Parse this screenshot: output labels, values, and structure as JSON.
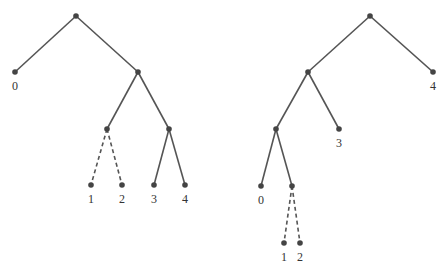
{
  "colors": {
    "edge": "#555555",
    "node": "#444444",
    "label": "#333333",
    "background": "#ffffff"
  },
  "trees": [
    {
      "name": "left-tree",
      "nodes": [
        {
          "id": "r",
          "x": 76,
          "y": 16,
          "label": ""
        },
        {
          "id": "l0",
          "x": 15,
          "y": 72,
          "label": "0"
        },
        {
          "id": "a",
          "x": 138,
          "y": 72,
          "label": ""
        },
        {
          "id": "b",
          "x": 107,
          "y": 129,
          "label": ""
        },
        {
          "id": "c",
          "x": 169,
          "y": 129,
          "label": ""
        },
        {
          "id": "l1",
          "x": 91,
          "y": 185,
          "label": "1"
        },
        {
          "id": "l2",
          "x": 122,
          "y": 185,
          "label": "2"
        },
        {
          "id": "l3",
          "x": 154,
          "y": 185,
          "label": "3"
        },
        {
          "id": "l4",
          "x": 185,
          "y": 185,
          "label": "4"
        }
      ],
      "edges": [
        {
          "from": "r",
          "to": "l0",
          "style": "solid"
        },
        {
          "from": "r",
          "to": "a",
          "style": "solid"
        },
        {
          "from": "a",
          "to": "b",
          "style": "solid"
        },
        {
          "from": "a",
          "to": "c",
          "style": "solid"
        },
        {
          "from": "b",
          "to": "l1",
          "style": "dashed"
        },
        {
          "from": "b",
          "to": "l2",
          "style": "dashed"
        },
        {
          "from": "c",
          "to": "l3",
          "style": "solid"
        },
        {
          "from": "c",
          "to": "l4",
          "style": "solid"
        }
      ]
    },
    {
      "name": "right-tree",
      "nodes": [
        {
          "id": "r",
          "x": 370,
          "y": 16,
          "label": ""
        },
        {
          "id": "l4",
          "x": 433,
          "y": 72,
          "label": "4"
        },
        {
          "id": "a",
          "x": 308,
          "y": 72,
          "label": ""
        },
        {
          "id": "b",
          "x": 276,
          "y": 129,
          "label": ""
        },
        {
          "id": "l3",
          "x": 339,
          "y": 129,
          "label": "3"
        },
        {
          "id": "l0",
          "x": 261,
          "y": 186,
          "label": "0"
        },
        {
          "id": "c",
          "x": 292,
          "y": 186,
          "label": ""
        },
        {
          "id": "l1",
          "x": 284,
          "y": 243,
          "label": "1"
        },
        {
          "id": "l2",
          "x": 300,
          "y": 243,
          "label": "2"
        }
      ],
      "edges": [
        {
          "from": "r",
          "to": "a",
          "style": "solid"
        },
        {
          "from": "r",
          "to": "l4",
          "style": "solid"
        },
        {
          "from": "a",
          "to": "b",
          "style": "solid"
        },
        {
          "from": "a",
          "to": "l3",
          "style": "solid"
        },
        {
          "from": "b",
          "to": "l0",
          "style": "solid"
        },
        {
          "from": "b",
          "to": "c",
          "style": "solid"
        },
        {
          "from": "c",
          "to": "l1",
          "style": "dashed"
        },
        {
          "from": "c",
          "to": "l2",
          "style": "dashed"
        }
      ]
    }
  ]
}
